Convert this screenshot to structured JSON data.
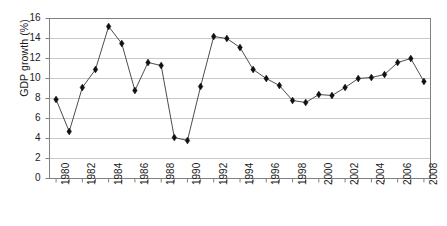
{
  "chart_data": {
    "type": "line",
    "title": "",
    "xlabel": "",
    "ylabel": "GDP growth (%)",
    "xlim": [
      1979.5,
      2008.5
    ],
    "ylim": [
      0,
      16
    ],
    "ytick_step": 2,
    "xtick_step": 1,
    "xtick_label_step": 2,
    "grid": "horizontal",
    "legend": "none",
    "marker": "diamond",
    "line_color": "#4d4d4d",
    "marker_color": "#111111",
    "grid_color": "#c8c8c8",
    "axis_color": "#808080",
    "x": [
      1980,
      1981,
      1982,
      1983,
      1984,
      1985,
      1986,
      1987,
      1988,
      1989,
      1990,
      1991,
      1992,
      1993,
      1994,
      1995,
      1996,
      1997,
      1998,
      1999,
      2000,
      2001,
      2002,
      2003,
      2004,
      2005,
      2006,
      2007,
      2008
    ],
    "values": [
      7.9,
      4.7,
      9.1,
      10.9,
      15.2,
      13.5,
      8.8,
      11.6,
      11.3,
      4.1,
      3.8,
      9.2,
      14.2,
      14.0,
      13.1,
      10.9,
      10.0,
      9.3,
      7.8,
      7.6,
      8.4,
      8.3,
      9.1,
      10.0,
      10.1,
      10.4,
      11.6,
      12.0,
      9.7
    ],
    "ytick_labels": [
      "0",
      "2",
      "4",
      "6",
      "8",
      "10",
      "12",
      "14",
      "16"
    ],
    "ytick_values": [
      0,
      2,
      4,
      6,
      8,
      10,
      12,
      14,
      16
    ],
    "xtick_labels": [
      "1980",
      "1982",
      "1984",
      "1986",
      "1988",
      "1990",
      "1992",
      "1994",
      "1996",
      "1998",
      "2000",
      "2002",
      "2004",
      "2006",
      "2008"
    ],
    "xtick_label_values": [
      1980,
      1982,
      1984,
      1986,
      1988,
      1990,
      1992,
      1994,
      1996,
      1998,
      2000,
      2002,
      2004,
      2006,
      2008
    ]
  }
}
